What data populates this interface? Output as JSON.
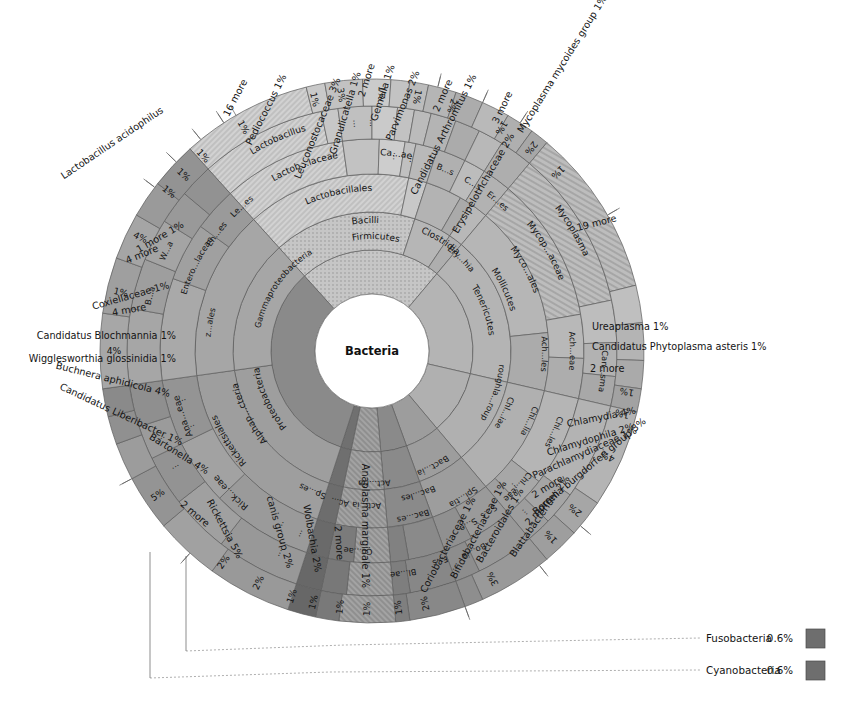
{
  "chart_data": {
    "type": "pie",
    "subtype": "krona-sunburst",
    "title": "Bacteria",
    "center_label": "Bacteria",
    "grid": false,
    "legend_position": "bottom-right",
    "rings": [
      "domain",
      "phylum",
      "class",
      "order",
      "family",
      "genus",
      "species"
    ],
    "palette": {
      "firmicutes": "#b8b8b8",
      "lactobacillus": "#cfcfcf",
      "tenericutes": "#a9a9a9",
      "mycoplasma": "#c4c4c4",
      "chlamydiae": "#b0b0b0",
      "spirochaetes": "#9d9d9d",
      "bacteroidetes": "#8a8a8a",
      "actinobacteria": "#7d7d7d",
      "proteobacteria": "#878787",
      "alphaproteobacteria": "#9b9b9b",
      "gammaproteobacteria": "#a3a3a3",
      "hub": "#ffffff",
      "stroke": "#5d5d5d",
      "legend_swatch": "#6e6e6e"
    },
    "inner_ring_labels": [
      {
        "text": "Firmicutes",
        "ring": 2
      },
      {
        "text": "Bacilli",
        "ring": 3
      },
      {
        "text": "Lactobacillales",
        "ring": 4
      },
      {
        "text": "Lactob...laceae",
        "ring": 5
      },
      {
        "text": "Lactobacillus",
        "ring": 6
      },
      {
        "text": "Ca...ae",
        "ring": 5
      },
      {
        "text": "B...s",
        "ring": 5
      },
      {
        "text": "C...s",
        "ring": 5
      },
      {
        "text": "Er...es",
        "ring": 5
      },
      {
        "text": "Clostridia",
        "ring": 3
      },
      {
        "text": "Ery...hia",
        "ring": 3
      },
      {
        "text": "Tenericutes",
        "ring": 2
      },
      {
        "text": "Mollicutes",
        "ring": 3
      },
      {
        "text": "Myco...ales",
        "ring": 4
      },
      {
        "text": "Mycop...aceae",
        "ring": 5
      },
      {
        "text": "Mycoplasma",
        "ring": 6
      },
      {
        "text": "Ach...les",
        "ring": 4
      },
      {
        "text": "Ach...eae",
        "ring": 5
      },
      {
        "text": "Can...sma",
        "ring": 6
      },
      {
        "text": "Chl...lia",
        "ring": 4
      },
      {
        "text": "Chl...les",
        "ring": 5
      },
      {
        "text": "Chl...eae",
        "ring": 5
      },
      {
        "text": "Chl...iae",
        "ring": 4
      },
      {
        "text": "roughla...roup",
        "ring": 3
      },
      {
        "text": "Spi...tia",
        "ring": 4
      },
      {
        "text": "S...s",
        "ring": 5
      },
      {
        "text": "S...e",
        "ring": 5
      },
      {
        "text": "Bo...ia",
        "ring": 5
      },
      {
        "text": "Bac...es",
        "ring": 4
      },
      {
        "text": "Bact...ia",
        "ring": 3
      },
      {
        "text": "Bac...les",
        "ring": 4
      },
      {
        "text": "F...s",
        "ring": 5
      },
      {
        "text": "Bl...ae",
        "ring": 5
      },
      {
        "text": "Act...ria",
        "ring": 3
      },
      {
        "text": "Act...ia",
        "ring": 4
      },
      {
        "text": "Co...ae",
        "ring": 5
      },
      {
        "text": "Proteobacteria",
        "ring": 2
      },
      {
        "text": "Alphap...cteria",
        "ring": 3
      },
      {
        "text": "Rickettsiales",
        "ring": 4
      },
      {
        "text": "Rick...eae",
        "ring": 5
      },
      {
        "text": "Ana...eae",
        "ring": 5
      },
      {
        "text": "Gammaproteobacteria",
        "ring": 3
      },
      {
        "text": "z...ales",
        "ring": 4
      },
      {
        "text": "Entero...laceae",
        "ring": 5
      },
      {
        "text": "Le...es",
        "ring": 5
      },
      {
        "text": "En...es",
        "ring": 5
      },
      {
        "text": "W...a",
        "ring": 6
      },
      {
        "text": "B...a",
        "ring": 6
      }
    ],
    "outer_labels": [
      {
        "label": "Lactobacillus acidophilus",
        "value": "",
        "side": "left"
      },
      {
        "label": "1 more",
        "value": "1%",
        "side": "left"
      },
      {
        "label": "4 more",
        "value": "",
        "side": "left"
      },
      {
        "label": "Coxiellaceae",
        "value": "1%",
        "side": "left"
      },
      {
        "label": "4 more",
        "value": "",
        "side": "left"
      },
      {
        "label": "Candidatus Blochmannia",
        "value": "1%",
        "side": "left"
      },
      {
        "label": "Wigglesworthia glossinidia",
        "value": "1%",
        "side": "left"
      },
      {
        "label": "Buchnera aphidicola",
        "value": "4%",
        "side": "left"
      },
      {
        "label": "Candidatus Liberibacter",
        "value": "1%",
        "side": "left"
      },
      {
        "label": "Bartonella",
        "value": "4%",
        "side": "left"
      },
      {
        "label": "2 more",
        "value": "",
        "side": "left"
      },
      {
        "label": "Rickettsia",
        "value": "5%",
        "side": "bottom-left"
      },
      {
        "label": "canis group",
        "value": "2%",
        "side": "bottom-left"
      },
      {
        "label": "Wolbachia",
        "value": "2%",
        "side": "bottom-left"
      },
      {
        "label": "2 more",
        "value": "",
        "side": "bottom-left"
      },
      {
        "label": "Anaplasma marginale",
        "value": "1%",
        "side": "bottom"
      },
      {
        "label": "Coriobacteriaceae",
        "value": "1%",
        "side": "bottom"
      },
      {
        "label": "Bifidobacteriaceae",
        "value": "1%",
        "side": "bottom"
      },
      {
        "label": "Bacteroidales",
        "value": "1%",
        "side": "bottom"
      },
      {
        "label": "Blattabacterium",
        "value": "2%",
        "side": "bottom"
      },
      {
        "label": "2 more",
        "value": "",
        "side": "bottom-right"
      },
      {
        "label": "Borrelia burgdorferi group",
        "value": "3%",
        "side": "bottom-right"
      },
      {
        "label": "2 more",
        "value": "",
        "side": "right"
      },
      {
        "label": "Parachlamydiaceae",
        "value": "1%",
        "side": "right"
      },
      {
        "label": "Chlamydophila",
        "value": "2%",
        "side": "right"
      },
      {
        "label": "Chlamydia",
        "value": "4%",
        "side": "right"
      },
      {
        "label": "2 more",
        "value": "",
        "side": "right"
      },
      {
        "label": "Candidatus Phytoplasma asteris",
        "value": "1%",
        "side": "right"
      },
      {
        "label": "Ureaplasma",
        "value": "1%",
        "side": "right"
      },
      {
        "label": "19 more",
        "value": "",
        "side": "top-right"
      },
      {
        "label": "Mycoplasma mycoides group",
        "value": "1%",
        "side": "top-right"
      },
      {
        "label": "Erysipelotrichaceae",
        "value": "2%",
        "side": "top"
      },
      {
        "label": "3 more",
        "value": "",
        "side": "top"
      },
      {
        "label": "Candidatus Arthromitus",
        "value": "1%",
        "side": "top"
      },
      {
        "label": "2 more",
        "value": "",
        "side": "top"
      },
      {
        "label": "Parvimonas",
        "value": "2%",
        "side": "top"
      },
      {
        "label": "Gemella",
        "value": "1%",
        "side": "top"
      },
      {
        "label": "2 more",
        "value": "",
        "side": "top"
      },
      {
        "label": "Granulicatella",
        "value": "1%",
        "side": "top"
      },
      {
        "label": "Leuconostocaceae",
        "value": "3%",
        "side": "top-left"
      },
      {
        "label": "Pediococcus",
        "value": "1%",
        "side": "top-left"
      },
      {
        "label": "16 more",
        "value": "",
        "side": "top-left"
      }
    ],
    "legend": [
      {
        "label": "Fusobacteria",
        "value": "0.6%",
        "color": "#6e6e6e"
      },
      {
        "label": "Cyanobacteria",
        "value": "0.6%",
        "color": "#6e6e6e"
      }
    ]
  }
}
